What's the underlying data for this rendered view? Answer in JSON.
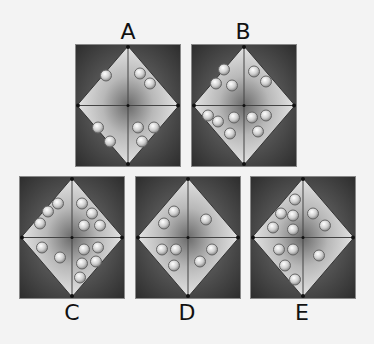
{
  "puzzle": {
    "options": [
      {
        "label": "A",
        "quadrants": {
          "top_left": 1,
          "top_right": 2,
          "bottom_left": 2,
          "bottom_right": 3
        },
        "circles": [
          [
            -22,
            -30
          ],
          [
            12,
            -32
          ],
          [
            22,
            -22
          ],
          [
            -30,
            22
          ],
          [
            -18,
            36
          ],
          [
            10,
            22
          ],
          [
            26,
            22
          ],
          [
            14,
            36
          ]
        ]
      },
      {
        "label": "B",
        "quadrants": {
          "top_left": 3,
          "top_right": 2,
          "bottom_left": 4,
          "bottom_right": 3
        },
        "circles": [
          [
            -20,
            -36
          ],
          [
            -28,
            -22
          ],
          [
            -12,
            -20
          ],
          [
            10,
            -34
          ],
          [
            22,
            -24
          ],
          [
            -36,
            10
          ],
          [
            -26,
            16
          ],
          [
            -10,
            12
          ],
          [
            -14,
            28
          ],
          [
            8,
            12
          ],
          [
            22,
            10
          ],
          [
            14,
            26
          ]
        ]
      },
      {
        "label": "C",
        "quadrants": {
          "top_left": 3,
          "top_right": 4,
          "bottom_left": 2,
          "bottom_right": 5
        },
        "circles": [
          [
            -14,
            -34
          ],
          [
            -24,
            -26
          ],
          [
            -32,
            -14
          ],
          [
            10,
            -34
          ],
          [
            20,
            -24
          ],
          [
            12,
            -12
          ],
          [
            28,
            -12
          ],
          [
            -30,
            10
          ],
          [
            -12,
            20
          ],
          [
            12,
            12
          ],
          [
            26,
            10
          ],
          [
            10,
            26
          ],
          [
            24,
            24
          ],
          [
            8,
            40
          ]
        ]
      },
      {
        "label": "D",
        "quadrants": {
          "top_left": 2,
          "top_right": 1,
          "bottom_left": 3,
          "bottom_right": 2
        },
        "circles": [
          [
            -14,
            -26
          ],
          [
            -24,
            -14
          ],
          [
            18,
            -18
          ],
          [
            -26,
            12
          ],
          [
            -12,
            12
          ],
          [
            -14,
            28
          ],
          [
            24,
            12
          ],
          [
            12,
            24
          ]
        ]
      },
      {
        "label": "E",
        "quadrants": {
          "top_left": 4,
          "top_right": 2,
          "bottom_left": 4,
          "bottom_right": 1
        },
        "circles": [
          [
            -8,
            -38
          ],
          [
            -22,
            -24
          ],
          [
            -10,
            -22
          ],
          [
            -30,
            -10
          ],
          [
            -10,
            -8
          ],
          [
            10,
            -24
          ],
          [
            22,
            -12
          ],
          [
            -24,
            12
          ],
          [
            -10,
            12
          ],
          [
            -18,
            28
          ],
          [
            -8,
            42
          ],
          [
            16,
            18
          ]
        ]
      }
    ]
  }
}
